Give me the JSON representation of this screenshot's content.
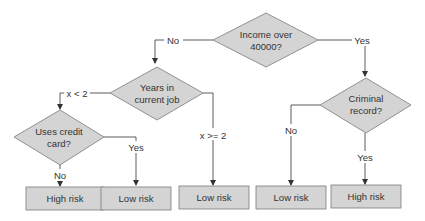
{
  "colors": {
    "node_fill": "#d4d4d4",
    "node_stroke": "#7a7a7a",
    "line": "#333333",
    "text": "#333333",
    "background": "#ffffff"
  },
  "diagram": {
    "type": "decision-tree",
    "decisions": [
      {
        "id": "income",
        "lines": [
          "Income over",
          "40000?"
        ]
      },
      {
        "id": "years",
        "lines": [
          "Years in",
          "current job"
        ]
      },
      {
        "id": "credit",
        "lines": [
          "Uses credit",
          "card?"
        ]
      },
      {
        "id": "criminal",
        "lines": [
          "Criminal",
          "record?"
        ]
      }
    ],
    "outcomes": [
      {
        "id": "out1",
        "label": "High risk"
      },
      {
        "id": "out2",
        "label": "Low risk"
      },
      {
        "id": "out3",
        "label": "Low risk"
      },
      {
        "id": "out4",
        "label": "Low risk"
      },
      {
        "id": "out5",
        "label": "High risk"
      }
    ],
    "edges": [
      {
        "from": "income",
        "to": "years",
        "label": "No"
      },
      {
        "from": "income",
        "to": "criminal",
        "label": "Yes"
      },
      {
        "from": "years",
        "to": "credit",
        "label": "x < 2"
      },
      {
        "from": "years",
        "to": "out3",
        "label": "x >= 2"
      },
      {
        "from": "credit",
        "to": "out1",
        "label": "No"
      },
      {
        "from": "credit",
        "to": "out2",
        "label": "Yes"
      },
      {
        "from": "criminal",
        "to": "out4",
        "label": "No"
      },
      {
        "from": "criminal",
        "to": "out5",
        "label": "Yes"
      }
    ]
  }
}
